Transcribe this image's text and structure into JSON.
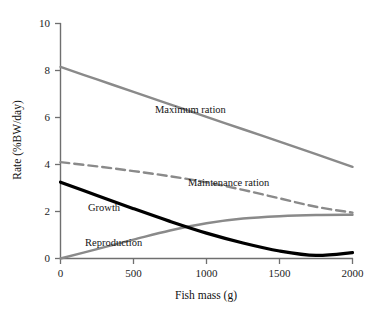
{
  "chart_data": {
    "type": "line",
    "title": "",
    "xlabel": "Fish mass (g)",
    "ylabel": "Rate (%BW/day)",
    "xlim": [
      0,
      2000
    ],
    "ylim": [
      0,
      10
    ],
    "xticks": [
      "0",
      "500",
      "1000",
      "1500",
      "2000"
    ],
    "xtick_values": [
      0,
      500,
      1000,
      1500,
      2000
    ],
    "yticks": [
      "0",
      "2",
      "4",
      "6",
      "8",
      "10"
    ],
    "ytick_values": [
      0,
      2,
      4,
      6,
      8,
      10
    ],
    "grid": false,
    "legend": "inline-curve-labels",
    "x": [
      0,
      250,
      500,
      750,
      1000,
      1250,
      1500,
      1750,
      2000
    ],
    "series": [
      {
        "name": "Maximum ration",
        "style": "solid",
        "color": "#8a8a8a",
        "values": [
          8.15,
          7.62,
          7.09,
          6.56,
          6.03,
          5.5,
          4.97,
          4.44,
          3.9
        ]
      },
      {
        "name": "Maintenance ration",
        "style": "dashed",
        "color": "#8a8a8a",
        "values": [
          4.1,
          3.92,
          3.72,
          3.5,
          3.24,
          2.92,
          2.56,
          2.2,
          1.95
        ]
      },
      {
        "name": "Growth",
        "style": "solid-thick",
        "color": "#000000",
        "values": [
          3.25,
          2.68,
          2.12,
          1.58,
          1.08,
          0.66,
          0.32,
          0.13,
          0.25
        ]
      },
      {
        "name": "Reproduction",
        "style": "solid",
        "color": "#8a8a8a",
        "values": [
          0.0,
          0.4,
          0.8,
          1.19,
          1.5,
          1.7,
          1.8,
          1.85,
          1.86
        ]
      }
    ],
    "annotations": [
      {
        "text": "Maximum ration",
        "x": 800,
        "y": 6.4
      },
      {
        "text": "Maintenance ration",
        "x": 1090,
        "y": 3.05
      },
      {
        "text": "Growth",
        "x": 330,
        "y": 2.25
      },
      {
        "text": "Reproduction",
        "x": 290,
        "y": 0.82
      }
    ]
  }
}
